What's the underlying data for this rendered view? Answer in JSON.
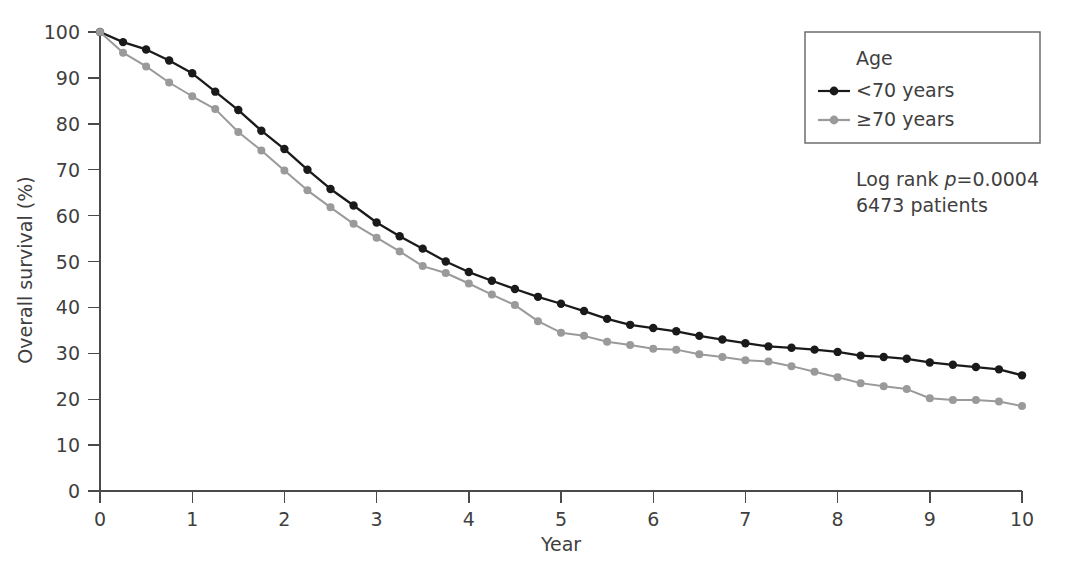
{
  "chart_data": {
    "type": "line",
    "title": "",
    "xlabel": "Year",
    "ylabel": "Overall survival (%)",
    "xlim": [
      0,
      10
    ],
    "ylim": [
      0,
      100
    ],
    "xticks": [
      "0",
      "1",
      "2",
      "3",
      "4",
      "5",
      "6",
      "7",
      "8",
      "9",
      "10"
    ],
    "yticks": [
      "0",
      "10",
      "20",
      "30",
      "40",
      "50",
      "60",
      "70",
      "80",
      "90",
      "100"
    ],
    "grid": false,
    "legend_position": "top-right",
    "legend_title": "Age",
    "x": [
      0,
      0.25,
      0.5,
      0.75,
      1,
      1.25,
      1.5,
      1.75,
      2,
      2.25,
      2.5,
      2.75,
      3,
      3.25,
      3.5,
      3.75,
      4,
      4.25,
      4.5,
      4.75,
      5,
      5.25,
      5.5,
      5.75,
      6,
      6.25,
      6.5,
      6.75,
      7,
      7.25,
      7.5,
      7.75,
      8,
      8.25,
      8.5,
      8.75,
      9,
      9.25,
      9.5,
      9.75,
      10
    ],
    "series": [
      {
        "name": "<70 years",
        "color": "#1a1a1a",
        "values": [
          100,
          97.8,
          96.2,
          93.8,
          91.0,
          87.0,
          83.0,
          78.5,
          74.5,
          70.0,
          65.8,
          62.2,
          58.5,
          55.5,
          52.8,
          50.0,
          47.7,
          45.8,
          44.0,
          42.3,
          40.8,
          39.2,
          37.5,
          36.2,
          35.5,
          34.8,
          33.8,
          33.0,
          32.2,
          31.5,
          31.2,
          30.8,
          30.3,
          29.5,
          29.2,
          28.8,
          28.0,
          27.5,
          27.0,
          26.5,
          25.2
        ]
      },
      {
        "name": "≥70 years",
        "color": "#9a9a9a",
        "values": [
          100,
          95.5,
          92.5,
          89.0,
          86.0,
          83.2,
          78.2,
          74.2,
          69.8,
          65.5,
          61.8,
          58.2,
          55.2,
          52.2,
          49.0,
          47.5,
          45.2,
          42.8,
          40.5,
          37.0,
          34.5,
          33.8,
          32.5,
          31.8,
          31.0,
          30.8,
          29.8,
          29.2,
          28.5,
          28.2,
          27.2,
          26.0,
          24.8,
          23.5,
          22.8,
          22.2,
          20.2,
          19.8,
          19.8,
          19.5,
          18.5
        ]
      }
    ],
    "annotations": [
      {
        "name": "log-rank-annotation",
        "prefix": "Log rank ",
        "italic": "p",
        "suffix": "=0.0004"
      },
      {
        "name": "patient-count-annotation",
        "text": "6473 patients"
      }
    ]
  }
}
